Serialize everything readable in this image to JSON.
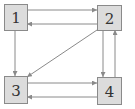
{
  "diagram": {
    "type": "directed-graph",
    "colors": {
      "node_fill": "#dcdcdc",
      "node_stroke": "#8a8a8a",
      "edge": "#8a8a8a",
      "label": "#333333",
      "background": "#ffffff"
    },
    "nodes": [
      {
        "id": "1",
        "label": "1",
        "x": 4,
        "y": 4,
        "w": 23,
        "h": 26
      },
      {
        "id": "2",
        "label": "2",
        "x": 97,
        "y": 5,
        "w": 24,
        "h": 25
      },
      {
        "id": "3",
        "label": "3",
        "x": 4,
        "y": 76,
        "w": 23,
        "h": 27
      },
      {
        "id": "4",
        "label": "4",
        "x": 97,
        "y": 77,
        "w": 24,
        "h": 27
      }
    ],
    "edges": [
      {
        "from": "1",
        "to": "2",
        "x1": 27,
        "y1": 10,
        "x2": 97,
        "y2": 10
      },
      {
        "from": "2",
        "to": "1",
        "x1": 97,
        "y1": 24,
        "x2": 27,
        "y2": 24
      },
      {
        "from": "1",
        "to": "3",
        "x1": 15,
        "y1": 30,
        "x2": 15,
        "y2": 76
      },
      {
        "from": "2",
        "to": "3",
        "x1": 97,
        "y1": 30,
        "x2": 27,
        "y2": 77
      },
      {
        "from": "2",
        "to": "4",
        "x1": 103,
        "y1": 30,
        "x2": 103,
        "y2": 77
      },
      {
        "from": "4",
        "to": "2",
        "x1": 115,
        "y1": 77,
        "x2": 115,
        "y2": 30
      },
      {
        "from": "3",
        "to": "4",
        "x1": 27,
        "y1": 83,
        "x2": 97,
        "y2": 83
      },
      {
        "from": "4",
        "to": "3",
        "x1": 97,
        "y1": 97,
        "x2": 27,
        "y2": 97
      }
    ]
  }
}
